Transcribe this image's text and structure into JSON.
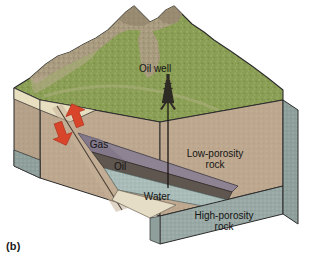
{
  "figure": {
    "caption": "(b)",
    "kind": "geologic-block-diagram"
  },
  "labels": {
    "oil_well": "Oil well",
    "gas": "Gas",
    "oil": "Oil",
    "water": "Water",
    "low_porosity_line1": "Low-porosity",
    "low_porosity_line2": "rock",
    "high_porosity_line1": "High-porosity",
    "high_porosity_line2": "rock"
  },
  "icons": {
    "derrick": "oil-derrick-icon",
    "well_bore": "wellbore-line-icon",
    "fault_arrow_up": "fault-arrow-up-icon",
    "fault_arrow_down": "fault-arrow-down-icon"
  },
  "colors": {
    "grass": "#8a9e55",
    "grass_dark": "#6f8444",
    "rock_ridge": "#a99a80",
    "ridge_shadow": "#8d8069",
    "soil_band": "#e8dfc0",
    "low_porosity_front": "#bda88f",
    "low_porosity_left": "#b5a089",
    "low_porosity_top": "#c9b59c",
    "high_porosity": "#98a8a4",
    "high_porosity_side": "#8fa09c",
    "gas": "#8d8393",
    "oil": "#5f5650",
    "water": "#a9bcb8",
    "arrow_red": "#d9452a",
    "outline": "#2b2b2b",
    "text": "#141414",
    "background": "#ffffff"
  }
}
